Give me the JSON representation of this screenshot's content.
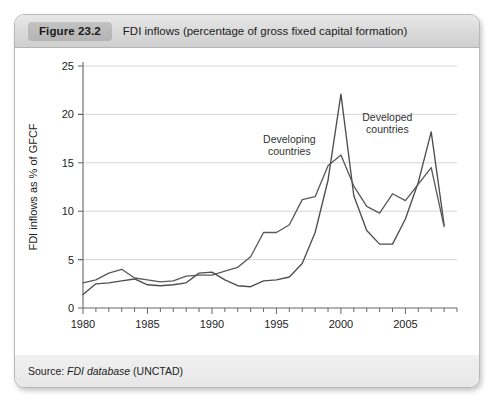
{
  "figure": {
    "number_label": "Figure 23.2",
    "caption": "FDI inflows (percentage of gross fixed capital formation)",
    "source_prefix": "Source: ",
    "source_italic": "FDI database",
    "source_suffix": " (UNCTAD)"
  },
  "chart_data": {
    "type": "line",
    "title": "FDI inflows (percentage of gross fixed capital formation)",
    "xlabel": "",
    "ylabel": "FDI inflows as % of GFCF",
    "xlim": [
      1980,
      2009
    ],
    "ylim": [
      0,
      25
    ],
    "ytick_labels": [
      "0",
      "5",
      "10",
      "15",
      "20",
      "25"
    ],
    "yticks": [
      0,
      5,
      10,
      15,
      20,
      25
    ],
    "xtick_labels": [
      "1980",
      "1985",
      "1990",
      "1995",
      "2000",
      "2005"
    ],
    "xticks": [
      1980,
      1985,
      1990,
      1995,
      2000,
      2005
    ],
    "xminor_step": 1,
    "grid": "horizontal",
    "legend_position": "inline-annotations",
    "x": [
      1980,
      1981,
      1982,
      1983,
      1984,
      1985,
      1986,
      1987,
      1988,
      1989,
      1990,
      1991,
      1992,
      1993,
      1994,
      1995,
      1996,
      1997,
      1998,
      1999,
      2000,
      2001,
      2002,
      2003,
      2004,
      2005,
      2006,
      2007,
      2008
    ],
    "series": [
      {
        "name": "Developed countries",
        "annotation": "Developed\ncountries",
        "color": "#4d4d4d",
        "values": [
          1.4,
          2.5,
          2.6,
          2.8,
          3.0,
          2.4,
          2.3,
          2.4,
          2.6,
          3.6,
          3.7,
          2.9,
          2.3,
          2.2,
          2.8,
          2.9,
          3.2,
          4.6,
          7.8,
          13.2,
          22.1,
          11.6,
          8.0,
          6.6,
          6.6,
          9.2,
          13.0,
          18.2,
          8.6
        ]
      },
      {
        "name": "Developing countries",
        "annotation": "Developing\ncountries",
        "color": "#5a5a5a",
        "values": [
          2.6,
          2.9,
          3.6,
          4.0,
          3.1,
          2.9,
          2.7,
          2.8,
          3.3,
          3.4,
          3.4,
          3.8,
          4.2,
          5.3,
          7.8,
          7.8,
          8.6,
          11.2,
          11.5,
          14.7,
          15.8,
          12.6,
          10.5,
          9.8,
          11.8,
          11.1,
          12.8,
          14.5,
          8.4
        ]
      }
    ],
    "annotations": [
      {
        "text_line1": "Developing",
        "text_line2": "countries",
        "x": 1996.0,
        "y": 17.0
      },
      {
        "text_line1": "Developed",
        "text_line2": "countries",
        "x": 2003.6,
        "y": 19.3
      }
    ]
  }
}
